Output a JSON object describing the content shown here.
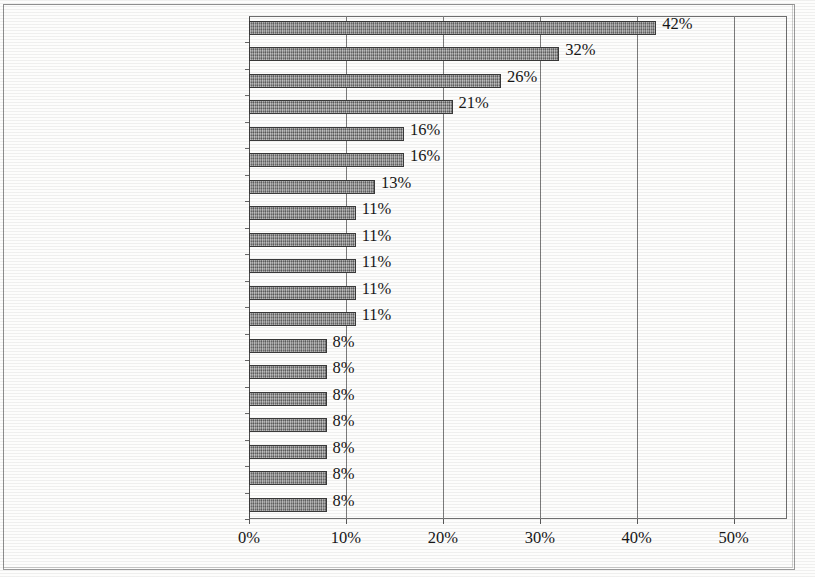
{
  "chart_data": {
    "type": "bar",
    "orientation": "horizontal",
    "title": "",
    "subtitle": "",
    "xlabel": "",
    "ylabel": "",
    "xlim": [
      0,
      55.5
    ],
    "xticks": [
      0,
      10,
      20,
      30,
      40,
      50
    ],
    "xtick_labels": [
      "0%",
      "10%",
      "20%",
      "30%",
      "40%",
      "50%"
    ],
    "grid": true,
    "grid_axis": "x",
    "legend": false,
    "value_label_suffix": "%",
    "categories": [
      "Wandern",
      "Berge",
      "Schöne Landschaft",
      "Schöne Seen",
      "Schlösser/Neuschwanstein",
      "Skifahren",
      "Kinder-/Familienfreundlich",
      "Erholung",
      "Gutes Klima/gute Luft",
      "Kultur/Geschichte",
      "Sommer- und Winterurlaub",
      "Unberührte Natur",
      "Aktivurlaub",
      "Almen/Kühe",
      "Familienurlaub",
      "Sportmöglichkeiten",
      "Urlaub auf dem Bauernhof",
      "Wald",
      "Wandermöglichkeiten"
    ],
    "values": [
      42,
      32,
      26,
      21,
      16,
      16,
      13,
      11,
      11,
      11,
      11,
      11,
      8,
      8,
      8,
      8,
      8,
      8,
      8
    ],
    "value_labels": [
      "42%",
      "32%",
      "26%",
      "21%",
      "16%",
      "16%",
      "13%",
      "11%",
      "11%",
      "11%",
      "11%",
      "11%",
      "8%",
      "8%",
      "8%",
      "8%",
      "8%",
      "8%",
      "8%"
    ],
    "colors": {
      "bar_fill": "#8d8d8d",
      "bar_edge": "#3a3a3a",
      "axis": "#6e6e6e",
      "grid": "#7b7b7b",
      "text": "#151515",
      "background": "#fdfdfc"
    }
  }
}
